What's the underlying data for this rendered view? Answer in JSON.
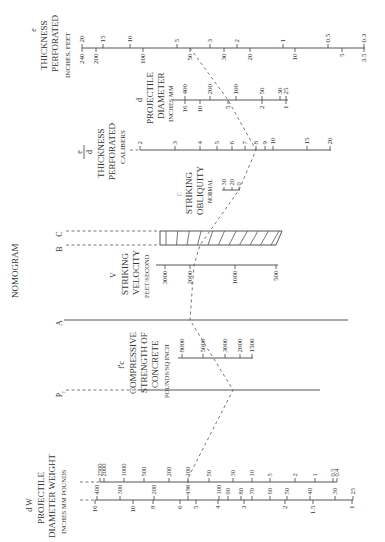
{
  "title": "NOMOGRAM",
  "scales": {
    "e": {
      "symbol": "e",
      "title1": "THICKNESS",
      "title2": "PERFORATED",
      "units": "INCHES, FEET",
      "feet_ticks": [
        {
          "label": "20",
          "x": 82
        },
        {
          "label": "15",
          "x": 103
        },
        {
          "label": "10",
          "x": 130
        },
        {
          "label": "5",
          "x": 177
        },
        {
          "label": "3",
          "x": 210
        },
        {
          "label": "2",
          "x": 237
        },
        {
          "label": "1",
          "x": 283
        },
        {
          "label": "0.5",
          "x": 328
        },
        {
          "label": "0.3",
          "x": 364
        }
      ],
      "inch_ticks": [
        {
          "label": "240",
          "x": 82
        },
        {
          "label": "200",
          "x": 96
        },
        {
          "label": "100",
          "x": 143
        },
        {
          "label": "50",
          "x": 190
        },
        {
          "label": "30",
          "x": 224
        },
        {
          "label": "20",
          "x": 250
        },
        {
          "label": "10",
          "x": 295
        },
        {
          "label": "5",
          "x": 342
        },
        {
          "label": "3.5",
          "x": 364
        }
      ]
    },
    "d": {
      "symbol": "d",
      "title1": "PROJECTILE",
      "title2": "DIAMETER",
      "units": "INCHES MM",
      "mm_ticks": [
        {
          "label": "400",
          "x": 185
        },
        {
          "label": "200",
          "x": 210
        },
        {
          "label": "100",
          "x": 236
        },
        {
          "label": "50",
          "x": 262
        },
        {
          "label": "30",
          "x": 280
        },
        {
          "label": "25",
          "x": 286
        }
      ],
      "inch_ticks": [
        {
          "label": "16",
          "x": 185
        },
        {
          "label": "10",
          "x": 200
        },
        {
          "label": "5",
          "x": 228
        },
        {
          "label": "2",
          "x": 262
        },
        {
          "label": "1",
          "x": 286
        }
      ]
    },
    "e_over_d": {
      "symbol_num": "e",
      "symbol_den": "d",
      "title1": "THICKNESS",
      "title2": "PERFORATED",
      "units": "CALIBERS",
      "ticks": [
        {
          "label": "2",
          "x": 140
        },
        {
          "label": "3",
          "x": 175
        },
        {
          "label": "4",
          "x": 200
        },
        {
          "label": "5",
          "x": 217
        },
        {
          "label": "6",
          "x": 232
        },
        {
          "label": "7",
          "x": 245
        },
        {
          "label": "8",
          "x": 256
        },
        {
          "label": "9",
          "x": 265
        },
        {
          "label": "10",
          "x": 273
        },
        {
          "label": "15",
          "x": 307
        },
        {
          "label": "20",
          "x": 330
        }
      ]
    },
    "obliquity": {
      "symbol": "□",
      "title1": "STRIKING",
      "title2": "OBLIQUITY",
      "units": "NORMAL",
      "ticks": [
        {
          "label": "30",
          "x": 224
        },
        {
          "label": "20",
          "x": 232
        },
        {
          "label": "0",
          "x": 239
        }
      ]
    },
    "B": {
      "label": "B"
    },
    "C": {
      "label": "C"
    },
    "V": {
      "symbol": "V",
      "title1": "STRIKING",
      "title2": "VELOCITY",
      "units": "FEET/SECOND",
      "ticks": [
        {
          "label": "3000",
          "x": 165
        },
        {
          "label": "2000",
          "x": 190
        },
        {
          "label": "1000",
          "x": 235
        },
        {
          "label": "500",
          "x": 276
        }
      ]
    },
    "A": {
      "label": "A"
    },
    "fc": {
      "symbol": "f'c",
      "title1": "COMPRESSIVE",
      "title2": "STRENGTH OF",
      "title3": "CONCRETE",
      "units": "POUNDS/SQ INCH",
      "ticks": [
        {
          "label": "8000",
          "x": 182
        },
        {
          "label": "5000",
          "x": 203
        },
        {
          "label": "3000",
          "x": 225
        },
        {
          "label": "2000",
          "x": 240
        },
        {
          "label": "1500",
          "x": 252
        }
      ]
    },
    "Pr": {
      "label": "P",
      "sub": "r"
    },
    "W": {
      "ticks": [
        {
          "label": "2500",
          "x": 100
        },
        {
          "label": "2000",
          "x": 104
        },
        {
          "label": "1000",
          "x": 124
        },
        {
          "label": "500",
          "x": 144
        },
        {
          "label": "200",
          "x": 169
        },
        {
          "label": "100",
          "x": 188
        },
        {
          "label": "50",
          "x": 209
        },
        {
          "label": "30",
          "x": 233
        },
        {
          "label": "10",
          "x": 252
        },
        {
          "label": "5",
          "x": 270
        },
        {
          "label": "2",
          "x": 295
        },
        {
          "label": "1",
          "x": 315
        },
        {
          "label": "0.5",
          "x": 333
        },
        {
          "label": "0.4",
          "x": 337
        }
      ]
    },
    "dW": {
      "symbol": "d W",
      "title1": "PROJECTILE",
      "title2": "DIAMETER WEIGHT",
      "units": "INCHES MM POUNDS",
      "mm_ticks": [
        {
          "label": "400",
          "x": 97
        },
        {
          "label": "300",
          "x": 120
        },
        {
          "label": "200",
          "x": 154
        },
        {
          "label": "150",
          "x": 188
        },
        {
          "label": "100",
          "x": 219
        },
        {
          "label": "90",
          "x": 228
        },
        {
          "label": "80",
          "x": 241
        },
        {
          "label": "70",
          "x": 252
        },
        {
          "label": "60",
          "x": 270
        },
        {
          "label": "50",
          "x": 287
        },
        {
          "label": "40",
          "x": 310
        },
        {
          "label": "30",
          "x": 335
        },
        {
          "label": "25",
          "x": 353
        }
      ],
      "inch_ticks": [
        {
          "label": "16",
          "x": 95
        },
        {
          "label": "10",
          "x": 133
        },
        {
          "label": "8",
          "x": 153
        },
        {
          "label": "6",
          "x": 180
        },
        {
          "label": "5",
          "x": 196
        },
        {
          "label": "4",
          "x": 218
        },
        {
          "label": "3",
          "x": 244
        },
        {
          "label": "2",
          "x": 285
        },
        {
          "label": "1.5",
          "x": 313
        },
        {
          "label": "1",
          "x": 352
        }
      ]
    }
  },
  "index_line": [
    [
      190,
      48
    ],
    [
      228,
      100
    ],
    [
      256,
      150
    ],
    [
      239,
      190
    ],
    [
      200,
      245
    ],
    [
      194,
      265
    ],
    [
      190,
      320
    ],
    [
      233,
      390
    ],
    [
      188,
      478
    ],
    [
      188,
      496
    ]
  ]
}
